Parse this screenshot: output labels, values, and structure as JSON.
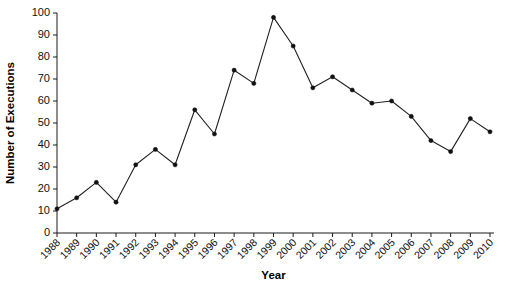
{
  "chart_data": {
    "type": "line",
    "title": "",
    "xlabel": "Year",
    "ylabel": "Number of Executions",
    "categories": [
      "1988",
      "1989",
      "1990",
      "1991",
      "1992",
      "1993",
      "1994",
      "1995",
      "1996",
      "1997",
      "1998",
      "1999",
      "2000",
      "2001",
      "2002",
      "2003",
      "2004",
      "2005",
      "2006",
      "2007",
      "2008",
      "2009",
      "2010"
    ],
    "x": [
      1988,
      1989,
      1990,
      1991,
      1992,
      1993,
      1994,
      1995,
      1996,
      1997,
      1998,
      1999,
      2000,
      2001,
      2002,
      2003,
      2004,
      2005,
      2006,
      2007,
      2008,
      2009,
      2010
    ],
    "values": [
      11,
      16,
      23,
      14,
      31,
      38,
      31,
      56,
      45,
      74,
      68,
      98,
      85,
      66,
      71,
      65,
      59,
      60,
      53,
      42,
      37,
      52,
      46
    ],
    "series": [
      {
        "name": "Number of Executions",
        "values": [
          11,
          16,
          23,
          14,
          31,
          38,
          31,
          56,
          45,
          74,
          68,
          98,
          85,
          66,
          71,
          65,
          59,
          60,
          53,
          42,
          37,
          52,
          46
        ]
      }
    ],
    "ylim": [
      0,
      100
    ],
    "yticks": [
      0,
      10,
      20,
      30,
      40,
      50,
      60,
      70,
      80,
      90,
      100
    ],
    "ytick_labels": [
      "0",
      "10",
      "20",
      "30",
      "40",
      "50",
      "60",
      "70",
      "80",
      "90",
      "100"
    ],
    "xlim": [
      1988,
      2010
    ],
    "grid": false,
    "legend": false,
    "legend_position": "none",
    "marker": "filled-circle",
    "line_color": "#222222",
    "marker_color": "#111111",
    "axis_color": "#1a1a1a",
    "background_color": "#ffffff",
    "xtick_rotation": 45
  }
}
